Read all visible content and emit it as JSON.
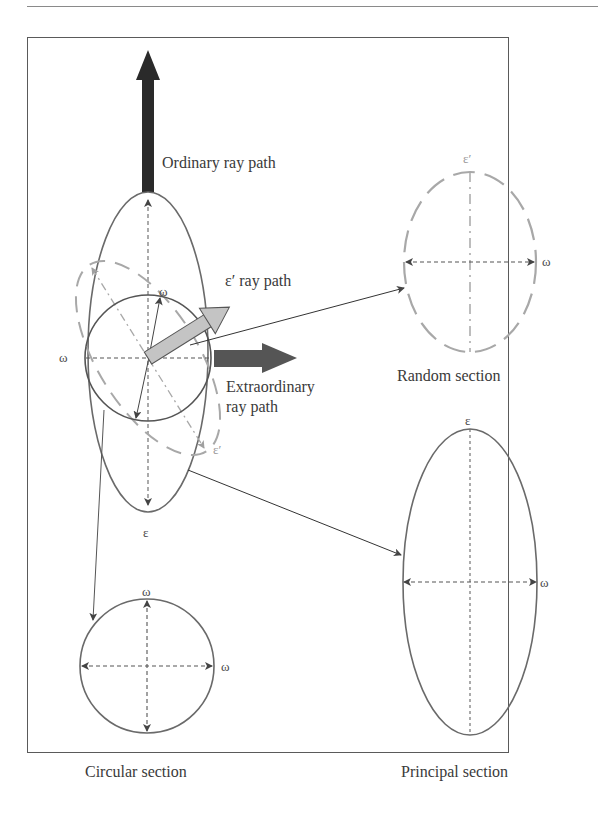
{
  "figure": {
    "labels": {
      "ordinary_ray": "Ordinary ray path",
      "eprime_ray": "ε′ ray path",
      "extraordinary_ray_line1": "Extraordinary",
      "extraordinary_ray_line2": "ray path",
      "random_section": "Random section",
      "principal_section": "Principal section",
      "circular_section": "Circular section"
    },
    "symbols": {
      "omega": "ω",
      "epsilon": "ε",
      "epsilon_prime": "ε′"
    },
    "colors": {
      "outline": "#6a6a6a",
      "dashed_grey": "#a0a0a0",
      "ordinary_arrow": "#2a2a2a",
      "extraordinary_arrow": "#555555",
      "eprime_arrow": "#c4c4c4"
    }
  }
}
